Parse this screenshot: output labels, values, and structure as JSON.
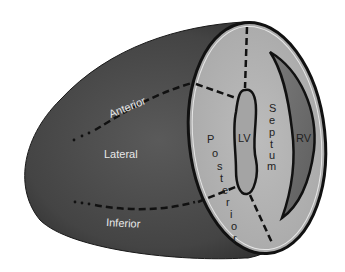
{
  "diagram": {
    "outer_labels": {
      "anterior": "Anterior",
      "lateral": "Lateral",
      "inferior": "Inferior"
    },
    "section_labels": {
      "lv": "LV",
      "rv": "RV",
      "septum_letters": [
        "S",
        "e",
        "p",
        "t",
        "u",
        "m"
      ],
      "posterior_letters": [
        "P",
        "o",
        "s",
        "t",
        "e",
        "r",
        "i",
        "o",
        "r"
      ]
    },
    "colors": {
      "body": "#4a4a4a",
      "body_dark": "#2e2e2e",
      "section_face": "#b8b8b8",
      "rv_fill": "#6e6e6e",
      "outline": "#111111",
      "light_text": "#e8e8e8"
    }
  }
}
